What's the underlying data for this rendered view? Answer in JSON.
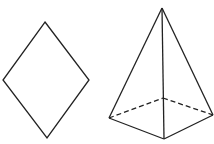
{
  "figures": [
    {
      "name": "rhombus",
      "stroke": "#222222",
      "points": [
        [
          45,
          22
        ],
        [
          89,
          80
        ],
        [
          47,
          138
        ],
        [
          3,
          80
        ]
      ]
    },
    {
      "name": "square-pyramid",
      "stroke": "#222222",
      "apex": [
        162,
        8
      ],
      "base_visible": [
        [
          109,
          118
        ],
        [
          164,
          139
        ],
        [
          213,
          115
        ]
      ],
      "base_hidden_vertex": [
        163,
        98
      ]
    }
  ]
}
